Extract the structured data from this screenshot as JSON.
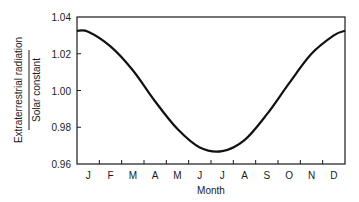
{
  "chart_data": {
    "type": "line",
    "title": "",
    "xlabel": "Month",
    "ylabel_numerator": "Extraterrestrial radiation",
    "ylabel_denominator": "Solar constant",
    "ylabel": "Extraterrestrial radiation / Solar constant",
    "categories": [
      "J",
      "F",
      "M",
      "A",
      "M",
      "J",
      "J",
      "A",
      "S",
      "O",
      "N",
      "D"
    ],
    "series": [
      {
        "name": "Extraterrestrial radiation / Solar constant",
        "values": [
          1.032,
          1.024,
          1.011,
          0.994,
          0.979,
          0.969,
          0.967,
          0.973,
          0.987,
          1.004,
          1.02,
          1.03
        ]
      }
    ],
    "ylim": [
      0.96,
      1.04
    ],
    "yticks": [
      "1.04",
      "1.02",
      "1.00",
      "0.98",
      "0.96"
    ],
    "grid": false,
    "legend": "none",
    "line_color": "#111111"
  }
}
